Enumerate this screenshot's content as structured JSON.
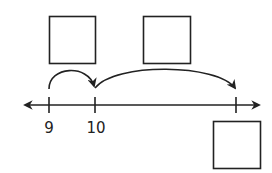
{
  "diagram": {
    "type": "number-line-jumps",
    "colors": {
      "stroke": "#222222",
      "background": "#ffffff"
    },
    "number_line": {
      "tick_labels": [
        "9",
        "10",
        ""
      ],
      "arrows_both_ends": true
    },
    "answer_boxes": [
      {
        "id": "box-1",
        "position": "above first jump",
        "value": ""
      },
      {
        "id": "box-2",
        "position": "above second jump",
        "value": ""
      },
      {
        "id": "box-3",
        "position": "below end tick",
        "value": ""
      }
    ],
    "jumps": [
      {
        "from": "9",
        "to": "10"
      },
      {
        "from": "10",
        "to": "end tick"
      }
    ]
  }
}
